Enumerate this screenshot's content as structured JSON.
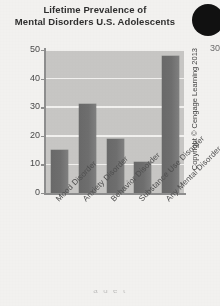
{
  "figure": {
    "title_line1": "Lifetime Prevalence of",
    "title_line2": "Mental Disorders U.S. Adolescents",
    "copyright": "Copyright © Cengage Learning 2013",
    "ghost_tick_label": "30",
    "bleed_text": "a d e t",
    "bar_color": "#6f6f6f",
    "panel_color": "#c9c8c6",
    "gridline_color": "#f3f2f0",
    "axis_color": "#8f8f8f",
    "corner_dot_color": "#111111"
  },
  "chart_data": {
    "type": "bar",
    "title": "Lifetime Prevalence of Mental Disorders U.S. Adolescents",
    "categories": [
      "Mood Disorder",
      "Anxiety Disorder",
      "Behavior Disorder",
      "Substance Use Disorder",
      "Any Mental Disorder"
    ],
    "values": [
      15,
      31,
      19,
      11,
      48
    ],
    "xlabel": "",
    "ylabel": "",
    "ylim": [
      0,
      50
    ],
    "yticks": [
      0,
      10,
      20,
      30,
      40,
      50
    ],
    "ytick_labels": [
      "0",
      "10",
      "20",
      "30",
      "40",
      "50"
    ],
    "grid": true,
    "legend": false
  }
}
